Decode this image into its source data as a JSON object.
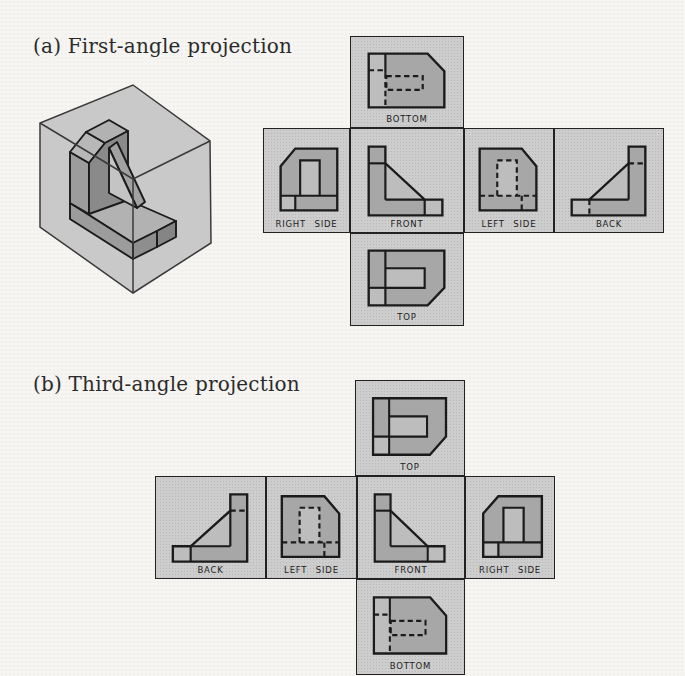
{
  "colors": {
    "background": "#f6f5f2",
    "panel_fill": "#cdcdcd",
    "shape_fill": "#a7a7a7",
    "shape_light": "#bdbdbd",
    "line": "#1b1b1b",
    "cube_fill": "#c9c9c9",
    "cube_line": "#3a3a3a"
  },
  "figure_a": {
    "title": "(a) First-angle projection",
    "panels": [
      {
        "view": "bottom",
        "label": "BOTTOM"
      },
      {
        "view": "right_side",
        "label": "RIGHT SIDE"
      },
      {
        "view": "front",
        "label": "FRONT"
      },
      {
        "view": "left_side",
        "label": "LEFT SIDE"
      },
      {
        "view": "back",
        "label": "BACK"
      },
      {
        "view": "top",
        "label": "TOP"
      }
    ]
  },
  "figure_b": {
    "title": "(b) Third-angle projection",
    "panels": [
      {
        "view": "top",
        "label": "TOP"
      },
      {
        "view": "back",
        "label": "BACK"
      },
      {
        "view": "left_side",
        "label": "LEFT SIDE"
      },
      {
        "view": "front",
        "label": "FRONT"
      },
      {
        "view": "right_side",
        "label": "RIGHT SIDE"
      },
      {
        "view": "bottom",
        "label": "BOTTOM"
      }
    ]
  }
}
